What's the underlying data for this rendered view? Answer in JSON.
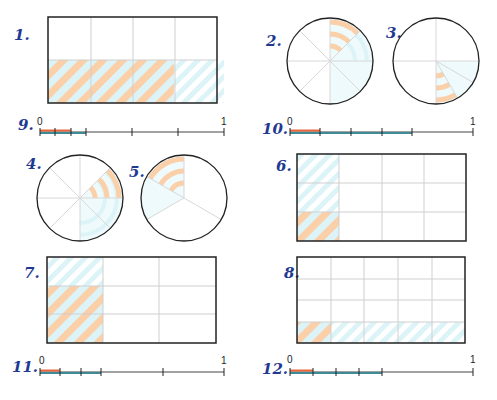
{
  "colors": {
    "orange": "#fbcfa8",
    "blue": "#dcf4f7",
    "orange_line": "#e8663d",
    "blue_line": "#3f8a94",
    "outline": "#222222",
    "grid": "#cfcfcf",
    "label": "#1f3a93"
  },
  "exercises": [
    {
      "number": "1.",
      "type": "rectangle",
      "cols": 4,
      "rows": 2,
      "blue_cells": [
        [
          1,
          0
        ],
        [
          1,
          1
        ],
        [
          1,
          2
        ],
        [
          1,
          3
        ]
      ],
      "orange_cells": [
        [
          1,
          0
        ],
        [
          1,
          1
        ],
        [
          1,
          2
        ]
      ],
      "fraction_orange": "3/8",
      "fraction_blue": "4/8"
    },
    {
      "number": "2.",
      "type": "circle",
      "sectors": 8,
      "blue": "1/2 (0°-180° clockwise from top)",
      "orange": "1/8 (0°-45°)"
    },
    {
      "number": "3.",
      "type": "circle",
      "sectors": "quarters, bottom-right quarter split into 3",
      "blue": "1/4 (90°-180°)",
      "orange": "1/12 (150°-180°)"
    },
    {
      "number": "4.",
      "type": "circle",
      "sectors": 8,
      "blue": "3/8 (45°-180°)",
      "orange": "1/8 (45°-90°)"
    },
    {
      "number": "5.",
      "type": "circle",
      "sectors": "thirds, top-left third split into 2",
      "blue": "1/3 (240°-360°)",
      "orange": "1/6 (300°-360°)"
    },
    {
      "number": "6.",
      "type": "rectangle",
      "cols": 4,
      "rows": 3,
      "blue_cells": [
        [
          0,
          0
        ],
        [
          1,
          0
        ],
        [
          2,
          0
        ]
      ],
      "orange_cells": [
        [
          2,
          0
        ]
      ],
      "fraction_orange": "1/12",
      "fraction_blue": "1/4"
    },
    {
      "number": "7.",
      "type": "rectangle",
      "cols": 3,
      "rows": 3,
      "blue_cells": [
        [
          0,
          0
        ],
        [
          1,
          0
        ],
        [
          2,
          0
        ]
      ],
      "orange_cells": [
        [
          1,
          0
        ],
        [
          2,
          0
        ]
      ],
      "fraction_orange": "2/9",
      "fraction_blue": "1/3"
    },
    {
      "number": "8.",
      "type": "rectangle",
      "cols": 5,
      "rows": 4,
      "blue_cells": [
        [
          3,
          0
        ],
        [
          3,
          1
        ],
        [
          3,
          2
        ],
        [
          3,
          3
        ],
        [
          3,
          4
        ]
      ],
      "orange_cells": [
        [
          3,
          0
        ]
      ],
      "fraction_orange": "1/20",
      "fraction_blue": "1/4"
    },
    {
      "number": "9.",
      "type": "number_line",
      "start_label": "0",
      "end_label": "1",
      "ticks": [
        0,
        0.0833,
        0.1667,
        0.25,
        0.5,
        0.75,
        1
      ],
      "orange_end": 0.1667,
      "blue_end": 0.25
    },
    {
      "number": "10.",
      "type": "number_line",
      "start_label": "0",
      "end_label": "1",
      "ticks": [
        0,
        0.1667,
        0.3333,
        0.5,
        0.6667,
        1
      ],
      "orange_end": 0.1667,
      "blue_end": 0.6667
    },
    {
      "number": "11.",
      "type": "number_line",
      "start_label": "0",
      "end_label": "1",
      "ticks": [
        0,
        0.1111,
        0.2222,
        0.3333,
        0.6667,
        1
      ],
      "orange_end": 0.1111,
      "blue_end": 0.3333
    },
    {
      "number": "12.",
      "type": "number_line",
      "start_label": "0",
      "end_label": "1",
      "ticks": [
        0,
        0.125,
        0.25,
        0.375,
        0.5,
        1
      ],
      "orange_end": 0.125,
      "blue_end": 0.5
    }
  ]
}
